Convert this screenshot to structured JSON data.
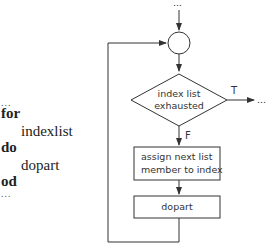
{
  "code": {
    "lines": [
      {
        "text": "...",
        "kind": "dots"
      },
      {
        "text": "for",
        "kind": "keyword"
      },
      {
        "text": "indexlist",
        "kind": "text"
      },
      {
        "text": "do",
        "kind": "keyword"
      },
      {
        "text": "dopart",
        "kind": "text"
      },
      {
        "text": "od",
        "kind": "keyword"
      },
      {
        "text": "...",
        "kind": "dots"
      }
    ]
  },
  "flowchart": {
    "entry_label": "...",
    "decision": {
      "line1": "index list",
      "line2": "exhausted"
    },
    "true_label": "T",
    "true_exit_label": "...",
    "false_label": "F",
    "assign_box": {
      "line1": "assign next list",
      "line2": "member to index"
    },
    "body_box": "dopart"
  },
  "colors": {
    "stroke": "#333333",
    "text": "#333333",
    "background": "#ffffff"
  }
}
